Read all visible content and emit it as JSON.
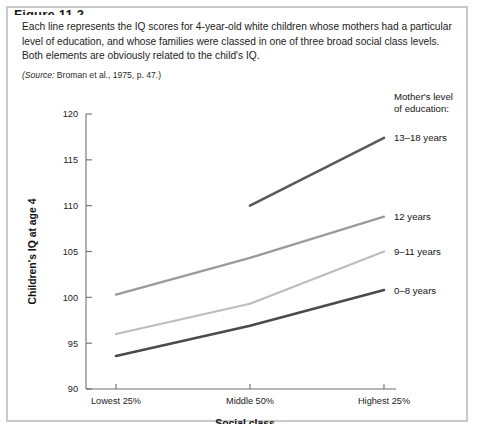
{
  "figure": {
    "title": "Figure 11.2",
    "caption": "Each line represents the IQ scores for 4-year-old white children whose mothers had a particular level of education, and whose families were classed in one of three broad social class levels. Both elements are obviously related to the child's IQ.",
    "source_label": "(Source:",
    "source_rest": " Broman et al., 1975, p. 47.)"
  },
  "legend": {
    "heading_line1": "Mother's level",
    "heading_line2": "of education:"
  },
  "chart_data": {
    "type": "line",
    "title": "",
    "xlabel": "Social class",
    "ylabel": "Children's IQ at age 4",
    "categories": [
      "Lowest 25%",
      "Middle 50%",
      "Highest 25%"
    ],
    "ylim": [
      90,
      120
    ],
    "yticks": [
      90,
      95,
      100,
      105,
      110,
      115,
      120
    ],
    "grid": false,
    "legend_position": "right-inline",
    "series": [
      {
        "name": "13–18 years",
        "color": "#595959",
        "width": 2.6,
        "x": [
          "Middle 50%",
          "Highest 25%"
        ],
        "values": [
          110.0,
          117.4
        ]
      },
      {
        "name": "12 years",
        "color": "#9a9a9a",
        "width": 2.3,
        "x": [
          "Lowest 25%",
          "Middle 50%",
          "Highest 25%"
        ],
        "values": [
          100.3,
          104.3,
          108.8
        ]
      },
      {
        "name": "9–11 years",
        "color": "#bdbdbd",
        "width": 2.3,
        "x": [
          "Lowest 25%",
          "Middle 50%",
          "Highest 25%"
        ],
        "values": [
          96.0,
          99.3,
          105.0
        ]
      },
      {
        "name": "0–8 years",
        "color": "#4a4a4a",
        "width": 2.6,
        "x": [
          "Lowest 25%",
          "Middle 50%",
          "Highest 25%"
        ],
        "values": [
          93.6,
          96.9,
          100.8
        ]
      }
    ]
  }
}
